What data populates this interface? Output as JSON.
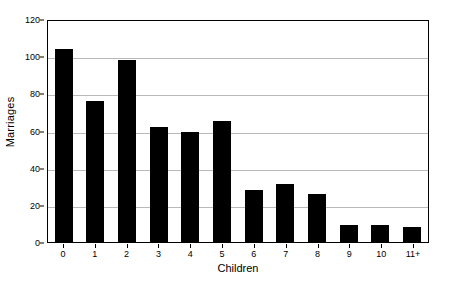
{
  "chart_data": {
    "type": "bar",
    "title": "",
    "xlabel": "Children",
    "ylabel": "Marriages",
    "categories": [
      "0",
      "1",
      "2",
      "3",
      "4",
      "5",
      "6",
      "7",
      "8",
      "9",
      "10",
      "11+"
    ],
    "values": [
      104,
      76,
      98,
      62,
      59,
      65,
      28,
      31,
      26,
      9,
      9,
      8
    ],
    "ylim": [
      0,
      120
    ],
    "yticks": [
      0,
      20,
      40,
      60,
      80,
      100,
      120
    ],
    "ytick_labels": [
      "0",
      "20",
      "40",
      "60",
      "80",
      "100",
      "120"
    ],
    "grid": true,
    "grid_axis": "y",
    "legend": false,
    "bar_color": "#000000",
    "grid_color": "#b9b9b9",
    "axis_color": "#000000",
    "background_color": "#ffffff"
  }
}
